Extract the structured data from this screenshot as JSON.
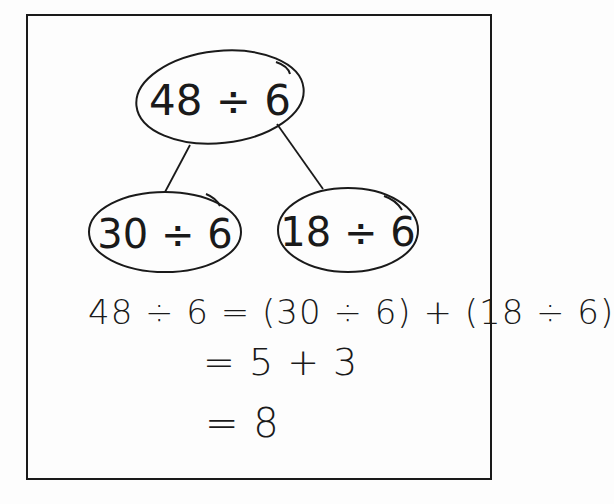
{
  "diagram": {
    "type": "number-bond",
    "root": {
      "label": "48 ÷ 6"
    },
    "children": [
      {
        "label": "30 ÷ 6"
      },
      {
        "label": "18 ÷ 6"
      }
    ]
  },
  "work": {
    "lines": [
      "48 ÷ 6 = (30 ÷ 6) + (18 ÷ 6)",
      "= 5 + 3",
      "= 8"
    ]
  },
  "colors": {
    "ink": "#1a1a1a",
    "paper": "#fdfdfd"
  }
}
